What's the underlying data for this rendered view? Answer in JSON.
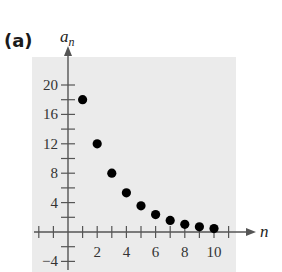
{
  "figure": {
    "part_label": "(a)"
  },
  "chart_data": {
    "type": "scatter",
    "title": "",
    "xlabel": "n",
    "ylabel": "a_n",
    "x": [
      1,
      2,
      3,
      4,
      5,
      6,
      7,
      8,
      9,
      10
    ],
    "values": [
      18,
      12,
      8,
      5.33,
      3.56,
      2.37,
      1.58,
      1.05,
      0.7,
      0.47
    ],
    "x_ticks": [
      2,
      4,
      6,
      8,
      10
    ],
    "y_ticks": [
      -4,
      4,
      8,
      12,
      16,
      20
    ],
    "xlim": [
      -2,
      11.5
    ],
    "ylim": [
      -4.5,
      22
    ],
    "grid": false,
    "background": "#ebebeb",
    "point_color": "#000000"
  }
}
